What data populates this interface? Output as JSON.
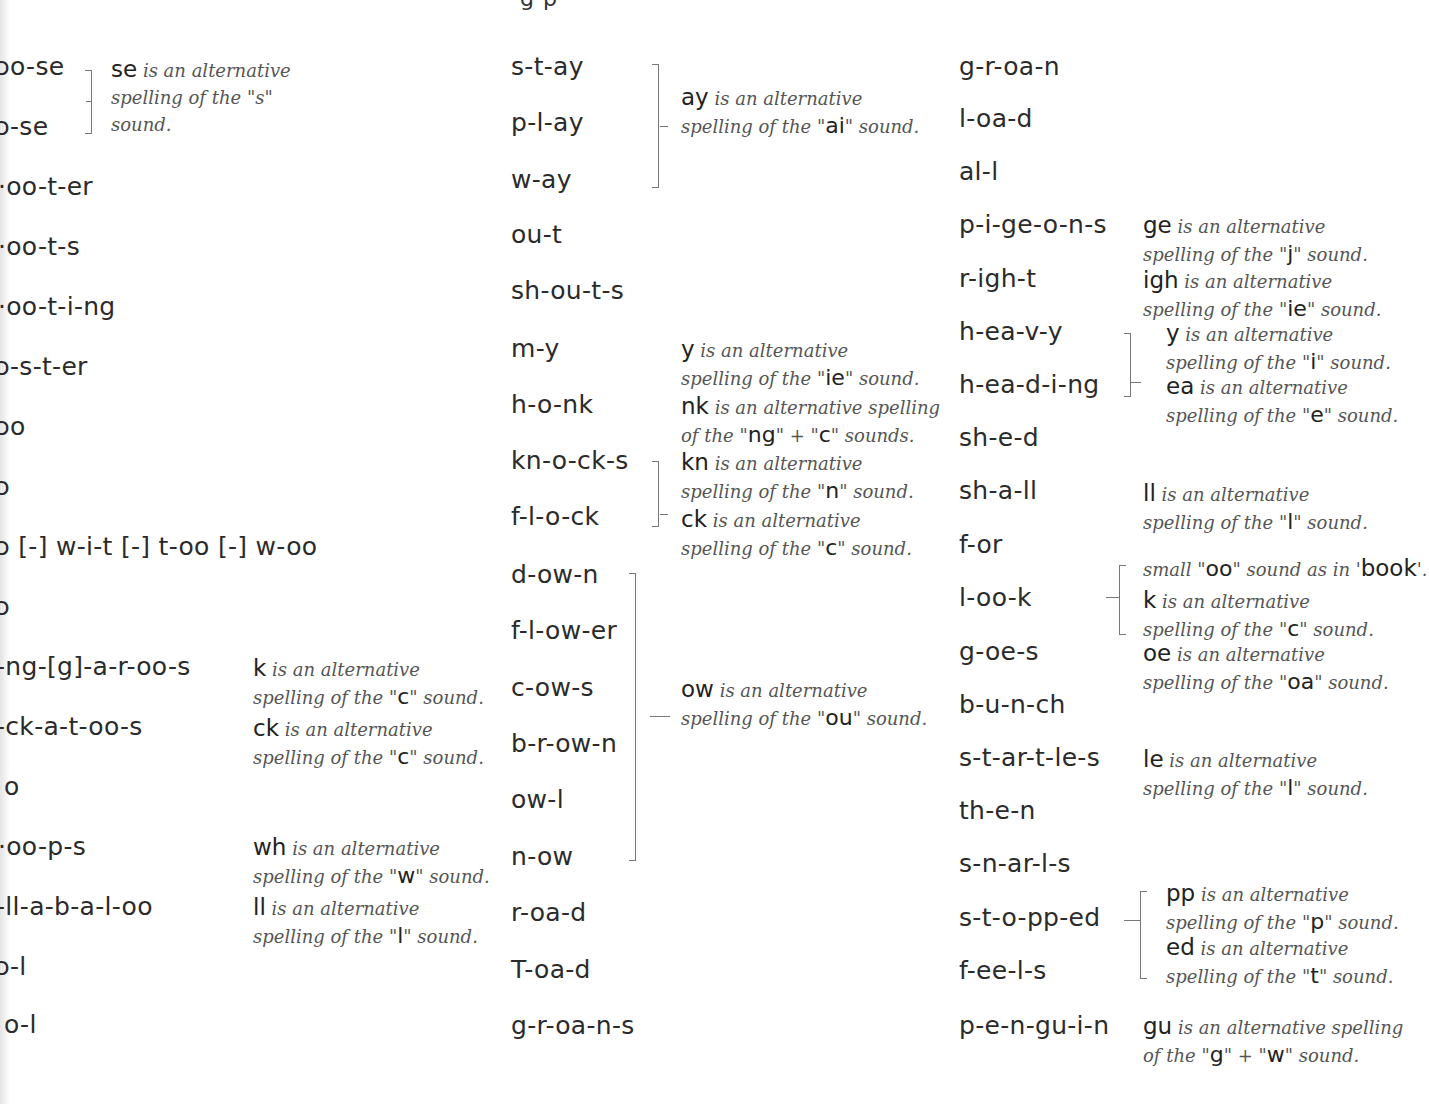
{
  "page": {
    "title_fragment": "g p"
  },
  "columns": [
    {
      "words": [
        {
          "text": "ɔo-se",
          "top": 52
        },
        {
          "text": "ɔ-se",
          "top": 112
        },
        {
          "text": "·oo-t-er",
          "top": 172
        },
        {
          "text": "·oo-t-s",
          "top": 232
        },
        {
          "text": "·oo-t-i-ng",
          "top": 292
        },
        {
          "text": "ɔ-s-t-er",
          "top": 352
        },
        {
          "text": "ɔo",
          "top": 412
        },
        {
          "text": "ɔ",
          "top": 472
        },
        {
          "text": "ɔ [-] w-i-t [-] t-oo [-] w-oo",
          "top": 532
        },
        {
          "text": "ɔ",
          "top": 592
        },
        {
          "text": "-ng-[g]-a-r-oo-s",
          "top": 652
        },
        {
          "text": "-ck-a-t-oo-s",
          "top": 712
        },
        {
          "text": "o",
          "top": 772
        },
        {
          "text": "·oo-p-s",
          "top": 832
        },
        {
          "text": "-ll-a-b-a-l-oo",
          "top": 892
        },
        {
          "text": "ɔ-l",
          "top": 952
        },
        {
          "text": "o-l",
          "top": 1010
        }
      ],
      "notes": [
        {
          "key": "se",
          "line1": "is an alternative",
          "line2": "spelling of the \"s\"",
          "line3": "sound.",
          "sound": ""
        },
        {
          "key": "k",
          "line1": "is an alternative",
          "line2pre": "spelling of the \"",
          "sound": "c",
          "line2post": "\" sound."
        },
        {
          "key": "ck",
          "line1": "is an alternative",
          "line2pre": "spelling of the \"",
          "sound": "c",
          "line2post": "\" sound."
        },
        {
          "key": "wh",
          "line1": "is an alternative",
          "line2pre": "spelling of the \"",
          "sound": "w",
          "line2post": "\" sound."
        },
        {
          "key": "ll",
          "line1": "is an alternative",
          "line2pre": "spelling of the \"",
          "sound": "l",
          "line2post": "\" sound."
        }
      ]
    },
    {
      "words": [
        {
          "text": "s-t-ay"
        },
        {
          "text": "p-l-ay"
        },
        {
          "text": "w-ay"
        },
        {
          "text": "ou-t"
        },
        {
          "text": "sh-ou-t-s"
        },
        {
          "text": "m-y"
        },
        {
          "text": "h-o-nk"
        },
        {
          "text": "kn-o-ck-s"
        },
        {
          "text": "f-l-o-ck"
        },
        {
          "text": "d-ow-n"
        },
        {
          "text": "f-l-ow-er"
        },
        {
          "text": "c-ow-s"
        },
        {
          "text": "b-r-ow-n"
        },
        {
          "text": "ow-l"
        },
        {
          "text": "n-ow"
        },
        {
          "text": "r-oa-d"
        },
        {
          "text": "T-oa-d"
        },
        {
          "text": "g-r-oa-n-s"
        }
      ],
      "notes": [
        {
          "key": "ay",
          "line1": "is an alternative",
          "line2pre": "spelling of the \"",
          "sound": "ai",
          "line2post": "\" sound."
        },
        {
          "key": "y",
          "line1": "is an alternative",
          "line2pre": "spelling of the \"",
          "sound": "ie",
          "line2post": "\" sound."
        },
        {
          "key": "nk",
          "line1": "is an alternative spelling",
          "line2pre": "of the \"",
          "sound": "ng",
          "mid": "\" + \"",
          "sound2": "c",
          "line2post": "\" sounds."
        },
        {
          "key": "kn",
          "line1": "is an alternative",
          "line2pre": " spelling of the \"",
          "sound": "n",
          "line2post": "\" sound."
        },
        {
          "key": "ck",
          "line1": "is an alternative",
          "line2pre": "spelling of the \"",
          "sound": "c",
          "line2post": "\" sound."
        },
        {
          "key": "ow",
          "line1": "is an alternative",
          "line2pre": "spelling of the \"",
          "sound": "ou",
          "line2post": "\" sound."
        }
      ]
    },
    {
      "words": [
        {
          "text": "g-r-oa-n"
        },
        {
          "text": "l-oa-d"
        },
        {
          "text": "al-l"
        },
        {
          "text": "p-i-ge-o-n-s"
        },
        {
          "text": "r-igh-t"
        },
        {
          "text": "h-ea-v-y"
        },
        {
          "text": "h-ea-d-i-ng"
        },
        {
          "text": "sh-e-d"
        },
        {
          "text": "sh-a-ll"
        },
        {
          "text": "f-or"
        },
        {
          "text": "l-oo-k"
        },
        {
          "text": "g-oe-s"
        },
        {
          "text": "b-u-n-ch"
        },
        {
          "text": "s-t-ar-t-le-s"
        },
        {
          "text": "th-e-n"
        },
        {
          "text": "s-n-ar-l-s"
        },
        {
          "text": "s-t-o-pp-ed"
        },
        {
          "text": "f-ee-l-s"
        },
        {
          "text": "p-e-n-gu-i-n"
        }
      ],
      "notes": [
        {
          "key": "ge",
          "line1": "is an alternative",
          "line2pre": "spelling of the \"",
          "sound": "j",
          "line2post": "\" sound."
        },
        {
          "key": "igh",
          "line1": "is an alternative",
          "line2pre": "spelling of the \"",
          "sound": "ie",
          "line2post": "\" sound."
        },
        {
          "key": "y",
          "line1": "is an alternative",
          "line2pre": "spelling of the \"",
          "sound": "i",
          "line2post": "\" sound."
        },
        {
          "key": "ea",
          "line1": "is an alternative",
          "line2pre": "spelling of the \"",
          "sound": "e",
          "line2post": "\" sound."
        },
        {
          "key": "ll",
          "line1": "is an alternative",
          "line2pre": "spelling of the \"",
          "sound": "l",
          "line2post": "\" sound."
        },
        {
          "key": "",
          "line1pre": "small \"",
          "sound": "oo",
          "line1mid": "\" sound as in '",
          "example": "book",
          "line1post": "'."
        },
        {
          "key": "k",
          "line1": "is an alternative",
          "line2pre": "spelling of the \"",
          "sound": "c",
          "line2post": "\" sound."
        },
        {
          "key": "oe",
          "line1": "is an alternative",
          "line2pre": "spelling of the \"",
          "sound": "oa",
          "line2post": "\" sound."
        },
        {
          "key": "le",
          "line1": "is an alternative",
          "line2pre": "spelling of the \"",
          "sound": "l",
          "line2post": "\" sound."
        },
        {
          "key": "pp",
          "line1": "is an alternative",
          "line2pre": "spelling of the \"",
          "sound": "p",
          "line2post": "\" sound."
        },
        {
          "key": "ed",
          "line1": "is an alternative",
          "line2pre": "spelling of the \"",
          "sound": "t",
          "line2post": "\" sound."
        },
        {
          "key": "gu",
          "line1": "is an alternative spelling",
          "line2pre": "of the \"",
          "sound": "g",
          "mid": "\" + \"",
          "sound2": "w",
          "line2post": "\" sound."
        }
      ]
    }
  ]
}
